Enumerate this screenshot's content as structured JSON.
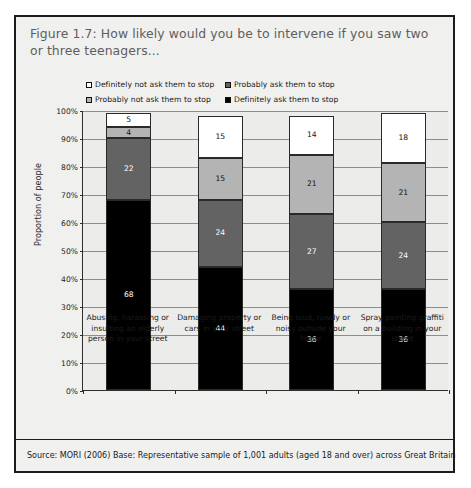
{
  "figure": {
    "title": "Figure 1.7: How likely would you be to intervene if you saw two or three teenagers...",
    "source": "Source: MORI (2006) Base: Representative sample of 1,001 adults (aged 18 and over) across Great Britain"
  },
  "chart_data": {
    "type": "bar",
    "subtype": "stacked-column-100",
    "title": "Figure 1.7: How likely would you be to intervene if you saw two or three teenagers...",
    "xlabel": "",
    "ylabel": "Proportion of people",
    "ylim": [
      0,
      100
    ],
    "ytick_labels": [
      "0%",
      "10%",
      "20%",
      "30%",
      "40%",
      "50%",
      "60%",
      "70%",
      "80%",
      "90%",
      "100%"
    ],
    "ytick_values": [
      0,
      10,
      20,
      30,
      40,
      50,
      60,
      70,
      80,
      90,
      100
    ],
    "grid": true,
    "legend_position": "top",
    "categories": [
      "Abusing, harassing or insulting an elderly person in your street",
      "Damaging property or cars in your street",
      "Being loud, rowdy or noisy outside your home",
      "Spray-painting graffiti on a building in your street"
    ],
    "category_lines": [
      [
        "Abusing, harassing or",
        "insulting an elderly",
        "person in your street"
      ],
      [
        "Damaging property or",
        "cars in your street"
      ],
      [
        "Being loud, rowdy or",
        "noisy outside your",
        "home"
      ],
      [
        "Spray-painting graffiti",
        "on a building in your",
        "street"
      ]
    ],
    "series": [
      {
        "name": "Definitely ask them to stop",
        "color": "#000000",
        "values": [
          68,
          44,
          36,
          36
        ]
      },
      {
        "name": "Probably ask them to stop",
        "color": "#636363",
        "values": [
          22,
          24,
          27,
          24
        ]
      },
      {
        "name": "Probably not ask them to stop",
        "color": "#b4b4b4",
        "values": [
          4,
          15,
          21,
          21
        ]
      },
      {
        "name": "Definitely not ask them to stop",
        "color": "#ffffff",
        "values": [
          5,
          15,
          14,
          18
        ]
      }
    ],
    "legend_entries": [
      {
        "label": "Definitely not ask them to stop",
        "color": "#ffffff"
      },
      {
        "label": "Probably ask them to stop",
        "color": "#636363"
      },
      {
        "label": "Probably not ask them to stop",
        "color": "#b4b4b4"
      },
      {
        "label": "Definitely ask them to stop",
        "color": "#000000"
      }
    ]
  }
}
